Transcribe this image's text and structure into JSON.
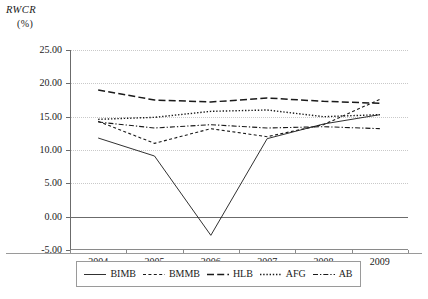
{
  "axes": {
    "y_title": "RWCR",
    "y_unit": "(%)",
    "y_ticks": [
      "25.00",
      "20.00",
      "15.00",
      "10.00",
      "5.00",
      "0.00",
      "-5.00"
    ],
    "x_ticks": [
      "2004",
      "2005",
      "2006",
      "2007",
      "2008",
      "2009"
    ]
  },
  "legend": {
    "items": [
      {
        "label": "BIMB",
        "style": "solid"
      },
      {
        "label": "BMMB",
        "style": "dashed"
      },
      {
        "label": "HLB",
        "style": "long-dash"
      },
      {
        "label": "AFG",
        "style": "dotted"
      },
      {
        "label": "AB",
        "style": "dash-dot"
      }
    ]
  },
  "chart_data": {
    "type": "line",
    "title": "",
    "xlabel": "",
    "ylabel": "RWCR (%)",
    "ylim": [
      -5.0,
      25.0
    ],
    "ytick_step": 5.0,
    "grid": true,
    "legend_position": "bottom",
    "x": [
      "2004",
      "2005",
      "2006",
      "2007",
      "2008",
      "2009"
    ],
    "categories": [
      "2004",
      "2005",
      "2006",
      "2007",
      "2008",
      "2009"
    ],
    "series": [
      {
        "name": "BIMB",
        "style": "solid",
        "values": [
          11.8,
          9.1,
          -2.8,
          11.7,
          13.9,
          15.3
        ]
      },
      {
        "name": "BMMB",
        "style": "dashed",
        "values": [
          14.3,
          11.0,
          13.2,
          12.0,
          13.8,
          17.6
        ]
      },
      {
        "name": "HLB",
        "style": "long-dash",
        "values": [
          19.0,
          17.5,
          17.2,
          17.8,
          17.3,
          17.0
        ]
      },
      {
        "name": "AFG",
        "style": "dotted",
        "values": [
          14.6,
          14.9,
          15.8,
          16.0,
          15.0,
          15.3
        ]
      },
      {
        "name": "AB",
        "style": "dash-dot",
        "values": [
          14.2,
          13.3,
          13.8,
          13.3,
          13.5,
          13.2
        ]
      }
    ]
  }
}
